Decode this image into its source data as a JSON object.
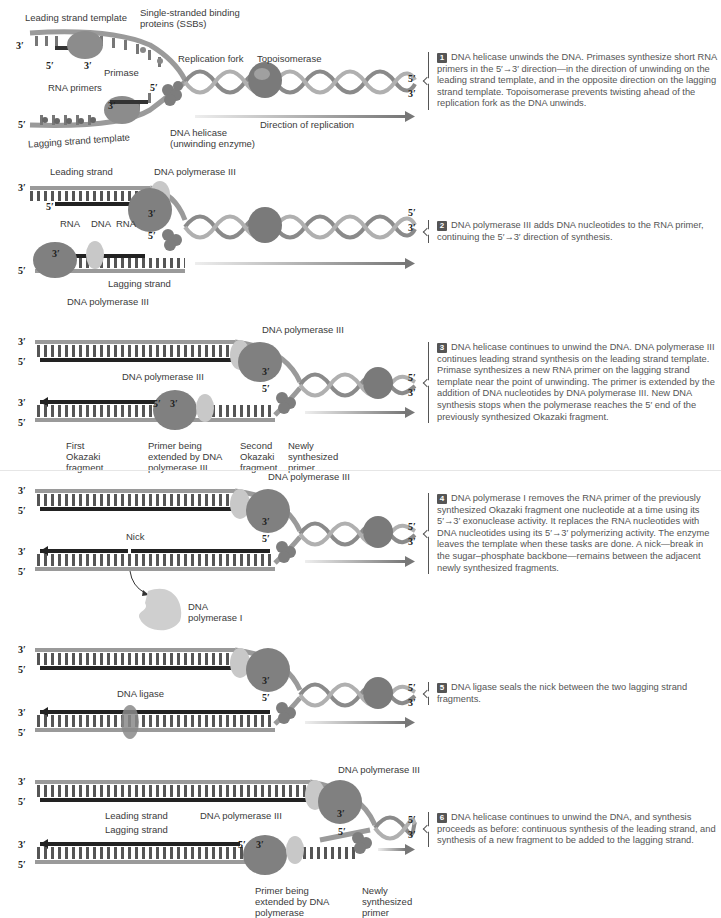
{
  "figure": {
    "panels": [
      {
        "step_number": "1",
        "step_text": "DNA helicase unwinds the DNA. Primases synthesize short RNA primers in the 5′→3′ direction—in the direction of unwinding on the leading strand template, and in the opposite direction on the lagging strand template. Topoisomerase prevents twisting ahead of the replication fork as the DNA unwinds.",
        "labels": {
          "leading_template": "Leading strand template",
          "ssb": "Single-stranded binding proteins (SSBs)",
          "fork": "Replication fork",
          "topo": "Topoisomerase",
          "primase": "Primase",
          "rna_primers": "RNA primers",
          "helicase": "DNA helicase (unwinding enzyme)",
          "direction": "Direction of replication",
          "lagging_template": "Lagging strand template"
        },
        "ends": {
          "top_left": "3′",
          "lag_left": "5′",
          "right_top": "5′",
          "right_bottom": "3′",
          "prim1_5": "5′",
          "prim1_3": "3′",
          "prim2_5": "5′",
          "prim2_3": "3′"
        }
      },
      {
        "step_number": "2",
        "step_text": "DNA polymerase III adds DNA nucleotides to the RNA primer, continuing the 5′→3′ direction of synthesis.",
        "labels": {
          "leading": "Leading strand",
          "pol3_top": "DNA polymerase III",
          "rna1": "RNA",
          "dna": "DNA",
          "rna2": "RNA",
          "lagging": "Lagging strand",
          "pol3_bottom": "DNA polymerase III"
        },
        "ends": {
          "top_left": "3′",
          "lead_left": "5′",
          "lag_left": "5′",
          "right_top": "5′",
          "right_bottom": "3′",
          "lead_3": "3′",
          "lag_3": "3′",
          "lag_5": "5′"
        }
      },
      {
        "step_number": "3",
        "step_text": "DNA helicase continues to unwind the DNA. DNA polymerase III continues leading strand synthesis on the leading strand template. Primase synthesizes a new RNA primer on the lagging strand template near the point of unwinding. The primer is extended by the addition of DNA nucleotides by DNA polymerase III. New DNA synthesis stops when the polymerase reaches the 5′ end of the previously synthesized Okazaki fragment.",
        "labels": {
          "pol3_top": "DNA polymerase III",
          "pol3_bottom": "DNA polymerase III",
          "first_okazaki": "First Okazaki fragment",
          "primer_extended": "Primer being extended by DNA polymerase III",
          "second_okazaki": "Second Okazaki fragment",
          "new_primer": "Newly synthesized primer"
        },
        "ends": {
          "t1": "3′",
          "t2": "5′",
          "b1": "3′",
          "b2": "5′",
          "right_top": "5′",
          "right_bottom": "3′",
          "lead_3": "3′",
          "lag_5a": "5′",
          "lag_3": "3′",
          "lag_5b": "5′"
        }
      },
      {
        "step_number": "4",
        "step_text": "DNA polymerase I removes the RNA primer of the previously synthesized Okazaki fragment one nucleotide at a time using its 5′→3′ exonuclease activity. It replaces the RNA nucleotides with DNA nucleotides using its 5′→3′ polymerizing activity. The enzyme leaves the template when these tasks are done. A nick—break in the sugar–phosphate backbone—remains between the adjacent newly synthesized fragments.",
        "labels": {
          "pol3": "DNA polymerase III",
          "nick": "Nick",
          "pol1": "DNA polymerase I"
        },
        "ends": {
          "t1": "3′",
          "t2": "5′",
          "b1": "3′",
          "b2": "5′",
          "right_top": "5′",
          "right_bottom": "3′",
          "lead_3": "3′",
          "lag_5": "5′"
        }
      },
      {
        "step_number": "5",
        "step_text": "DNA ligase seals the nick between the two lagging strand fragments.",
        "labels": {
          "ligase": "DNA ligase"
        },
        "ends": {
          "t1": "3′",
          "t2": "5′",
          "b1": "3′",
          "b2": "5′",
          "right_top": "5′",
          "right_bottom": "3′",
          "lead_3": "3′",
          "lag_5": "5′"
        }
      },
      {
        "step_number": "6",
        "step_text": "DNA helicase continues to unwind the DNA, and synthesis proceeds as before: continuous synthesis of the leading strand, and synthesis of a new fragment to be added to the lagging strand.",
        "labels": {
          "pol3_top": "DNA polymerase III",
          "leading": "Leading strand",
          "lagging": "Lagging strand",
          "pol3_bottom": "DNA polymerase III",
          "primer_extended": "Primer being extended by DNA polymerase",
          "new_primer": "Newly synthesized primer"
        },
        "ends": {
          "t1": "3′",
          "t2": "5′",
          "b1": "3′",
          "b2": "5′",
          "right_top": "5′",
          "right_bottom": "3′",
          "lead_3": "3′",
          "lag_5a": "5′",
          "lag_3": "3′",
          "lag_5b": "5′"
        }
      }
    ],
    "colors": {
      "backbone": "#9a9a9a",
      "new_strand": "#222222",
      "enzyme": "#7a7a7a",
      "clamp": "#c8c8c8",
      "arrow": "#8a8a8a",
      "step_badge": "#555555"
    }
  }
}
